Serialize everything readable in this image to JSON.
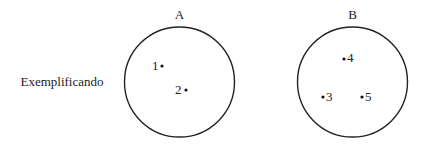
{
  "diagram": {
    "side_label": "Exemplificando",
    "stroke_color": "#222222",
    "sets": [
      {
        "name": "A",
        "cx": 179.5,
        "cy": 82,
        "r": 55,
        "points": [
          {
            "label": "1",
            "x": 162,
            "y": 66,
            "label_x": 150,
            "label_y": 70,
            "anchor": "start"
          },
          {
            "label": "2",
            "x": 186,
            "y": 90,
            "label_x": 174,
            "label_y": 94,
            "anchor": "start"
          }
        ]
      },
      {
        "name": "B",
        "cx": 352.5,
        "cy": 82,
        "r": 55,
        "points": [
          {
            "label": "4",
            "x": 344,
            "y": 59,
            "label_x": 347,
            "label_y": 62,
            "anchor": "start"
          },
          {
            "label": "3",
            "x": 323,
            "y": 97,
            "label_x": 326,
            "label_y": 101,
            "anchor": "start"
          },
          {
            "label": "5",
            "x": 362,
            "y": 97,
            "label_x": 365,
            "label_y": 101,
            "anchor": "start"
          }
        ]
      }
    ]
  }
}
